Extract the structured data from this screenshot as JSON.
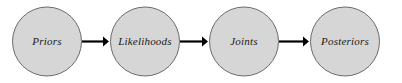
{
  "diagram": {
    "background_color": "#ffffff",
    "node_fill_color": "#d6d6d6",
    "node_stroke_color": "#6b6b6b",
    "edge_color": "#000000",
    "label_color": "#1a1a1a",
    "nodes": [
      {
        "id": "priors",
        "label": "Priors",
        "cx": 47,
        "cy": 41.5,
        "r": 34.5
      },
      {
        "id": "likelihoods",
        "label": "Likelihoods",
        "cx": 145,
        "cy": 41.5,
        "r": 34.5
      },
      {
        "id": "joints",
        "label": "Joints",
        "cx": 244,
        "cy": 41.5,
        "r": 34.5
      },
      {
        "id": "posteriors",
        "label": "Posteriors",
        "cx": 345,
        "cy": 41.5,
        "r": 34.5
      }
    ],
    "edges": [
      {
        "id": "priors-to-likelihoods",
        "from": "priors",
        "to": "likelihoods",
        "x1": 82,
        "x2": 109,
        "y": 41.5
      },
      {
        "id": "likelihoods-to-joints",
        "from": "likelihoods",
        "to": "joints",
        "x1": 180,
        "x2": 208,
        "y": 41.5
      },
      {
        "id": "joints-to-posteriors",
        "from": "joints",
        "to": "posteriors",
        "x1": 279,
        "x2": 309,
        "y": 41.5
      }
    ]
  }
}
